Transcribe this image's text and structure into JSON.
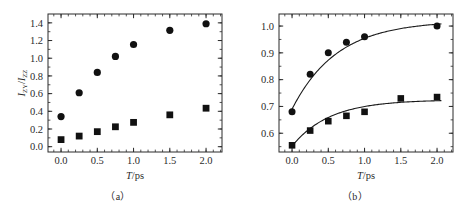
{
  "figure": {
    "background": "#ffffff",
    "ink_color": "#2b2b2b",
    "marker_color": "#111111"
  },
  "panels": [
    {
      "id": "a",
      "caption": "（a）",
      "xlabel_italic": "T",
      "xlabel_rest": "/ps",
      "ylabel_num_main": "I",
      "ylabel_num_sub": "ZY",
      "ylabel_den_main": "I",
      "ylabel_den_sub": "ZZ",
      "xticks": [
        "0.0",
        "0.5",
        "1.0",
        "1.5",
        "2.0"
      ],
      "yticks": [
        "0.0",
        "0.2",
        "0.4",
        "0.6",
        "0.8",
        "1.0",
        "1.2",
        "1.4"
      ]
    },
    {
      "id": "b",
      "caption": "（b）",
      "xlabel_italic": "T",
      "xlabel_rest": "/ps",
      "xticks": [
        "0.0",
        "0.5",
        "1.0",
        "1.5",
        "2.0"
      ],
      "yticks": [
        "0.6",
        "0.7",
        "0.8",
        "0.9",
        "1.0"
      ]
    }
  ],
  "chart_data": [
    {
      "type": "scatter",
      "panel": "a",
      "title": "",
      "xlabel": "T/ps",
      "ylabel": "I_ZY/I_ZZ",
      "xlim": [
        -0.18,
        2.22
      ],
      "ylim": [
        -0.06,
        1.5
      ],
      "xticks": [
        0.0,
        0.5,
        1.0,
        1.5,
        2.0
      ],
      "yticks": [
        0.0,
        0.2,
        0.4,
        0.6,
        0.8,
        1.0,
        1.2,
        1.4
      ],
      "grid": false,
      "legend": "none",
      "series": [
        {
          "name": "circles",
          "marker": "circle",
          "x": [
            0.0,
            0.25,
            0.5,
            0.75,
            1.0,
            1.5,
            2.0
          ],
          "values": [
            0.34,
            0.61,
            0.84,
            1.02,
            1.155,
            1.315,
            1.39
          ]
        },
        {
          "name": "squares",
          "marker": "square",
          "x": [
            0.0,
            0.25,
            0.5,
            0.75,
            1.0,
            1.5,
            2.0
          ],
          "values": [
            0.08,
            0.12,
            0.17,
            0.225,
            0.275,
            0.36,
            0.435
          ]
        }
      ]
    },
    {
      "type": "scatter",
      "panel": "b",
      "title": "",
      "xlabel": "T/ps",
      "ylabel": "",
      "xlim": [
        -0.18,
        2.22
      ],
      "ylim": [
        0.53,
        1.045
      ],
      "xticks": [
        0.0,
        0.5,
        1.0,
        1.5,
        2.0
      ],
      "yticks": [
        0.6,
        0.7,
        0.8,
        0.9,
        1.0
      ],
      "grid": false,
      "legend": "none",
      "series": [
        {
          "name": "circles",
          "marker": "circle",
          "fit": true,
          "x": [
            0.0,
            0.25,
            0.5,
            0.75,
            1.0,
            2.0
          ],
          "values": [
            0.68,
            0.82,
            0.9,
            0.94,
            0.96,
            1.0
          ]
        },
        {
          "name": "squares",
          "marker": "square",
          "fit": true,
          "x": [
            0.0,
            0.25,
            0.5,
            0.75,
            1.0,
            1.5,
            2.0
          ],
          "values": [
            0.555,
            0.61,
            0.645,
            0.665,
            0.68,
            0.73,
            0.735
          ]
        }
      ],
      "fit_curves": [
        {
          "name": "circles-fit",
          "asymptote": 1.02,
          "start": 0.69,
          "tau": 0.62
        },
        {
          "name": "squares-fit",
          "asymptote": 0.725,
          "start": 0.552,
          "tau": 0.52
        }
      ]
    }
  ]
}
